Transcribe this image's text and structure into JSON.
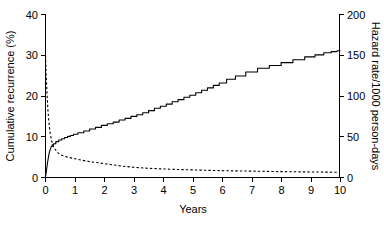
{
  "chart_data": {
    "type": "line",
    "title": "",
    "xlabel": "Years",
    "ylabel": "Cumulative recurrence (%)",
    "y2label": "Hazard rate/1000 person-days",
    "xlim": [
      0,
      10
    ],
    "ylim": [
      0,
      40
    ],
    "y2lim": [
      0,
      200
    ],
    "xticks": [
      0,
      1,
      2,
      3,
      4,
      5,
      6,
      7,
      8,
      9,
      10
    ],
    "xtick_labels": [
      "0",
      "1",
      "2",
      "3",
      "4",
      "5",
      "6",
      "7",
      "8",
      "9",
      "10"
    ],
    "yticks": [
      0,
      10,
      20,
      30,
      40
    ],
    "ytick_labels": [
      "0",
      "10",
      "20",
      "30",
      "40"
    ],
    "y2ticks": [
      0,
      50,
      100,
      150,
      200
    ],
    "y2tick_labels": [
      "0",
      "50",
      "100",
      "150",
      "200"
    ],
    "grid": false,
    "legend": null,
    "series": [
      {
        "name": "Cumulative recurrence",
        "style": "solid",
        "axis": "left",
        "units": "%",
        "x": [
          0,
          0.03,
          0.06,
          0.09,
          0.12,
          0.16,
          0.2,
          0.25,
          0.3,
          0.4,
          0.5,
          0.6,
          0.7,
          0.8,
          0.9,
          1.0,
          1.2,
          1.4,
          1.6,
          1.8,
          2.0,
          2.2,
          2.4,
          2.6,
          2.8,
          3.0,
          3.2,
          3.4,
          3.6,
          3.8,
          4.0,
          4.2,
          4.4,
          4.6,
          4.8,
          5.0,
          5.2,
          5.4,
          5.6,
          5.8,
          6.0,
          6.3,
          6.6,
          7.0,
          7.4,
          7.8,
          8.2,
          8.6,
          9.0,
          9.3,
          9.6,
          9.8,
          10.0
        ],
        "y": [
          0,
          1.6,
          3.2,
          4.6,
          5.8,
          6.9,
          7.6,
          8.0,
          8.3,
          8.8,
          9.2,
          9.5,
          9.8,
          10.1,
          10.3,
          10.6,
          11.0,
          11.4,
          11.9,
          12.3,
          12.8,
          13.2,
          13.6,
          14.1,
          14.5,
          15.0,
          15.4,
          15.9,
          16.4,
          17.0,
          17.5,
          18.0,
          18.6,
          19.1,
          19.7,
          20.2,
          20.8,
          21.4,
          22.0,
          22.6,
          23.2,
          24.1,
          24.9,
          25.9,
          26.8,
          27.5,
          28.2,
          28.9,
          29.6,
          30.1,
          30.6,
          30.9,
          31.1
        ]
      },
      {
        "name": "Hazard rate",
        "style": "dashed",
        "axis": "right",
        "units": "per 1000 person-days",
        "x": [
          0,
          0.02,
          0.05,
          0.08,
          0.12,
          0.16,
          0.2,
          0.25,
          0.3,
          0.4,
          0.5,
          0.65,
          0.8,
          1.0,
          1.2,
          1.4,
          1.6,
          1.8,
          2.0,
          2.3,
          2.6,
          3.0,
          3.4,
          3.8,
          4.2,
          4.6,
          5.0,
          5.5,
          6.0,
          6.5,
          7.0,
          7.5,
          8.0,
          8.5,
          9.0,
          9.5,
          10.0
        ],
        "y": [
          150,
          128,
          104,
          84,
          66,
          54,
          46,
          40,
          36,
          31,
          28,
          26,
          24.5,
          23,
          21.5,
          20,
          19,
          18,
          17,
          15.5,
          14,
          12.5,
          11.5,
          10.8,
          10.2,
          9.7,
          9.3,
          8.8,
          8.4,
          8.1,
          7.8,
          7.5,
          7.2,
          7.0,
          6.8,
          6.6,
          6.4
        ]
      }
    ]
  },
  "figure": {
    "background": "#ffffff",
    "line_color": "#000000"
  }
}
